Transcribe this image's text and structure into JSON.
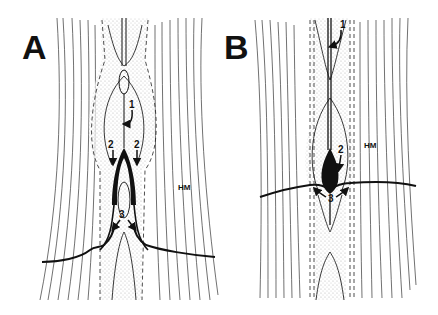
{
  "figure": {
    "panels": [
      {
        "label": "A",
        "tissue_label": "HM",
        "arrows": [
          {
            "number": "1",
            "target": "central-tube-upper"
          },
          {
            "number": "2",
            "target": "left-black-wedge"
          },
          {
            "number": "2",
            "target": "right-black-wedge"
          },
          {
            "number": "3",
            "target": "lower-branch-junction"
          }
        ]
      },
      {
        "label": "B",
        "tissue_label": "HM",
        "arrows": [
          {
            "number": "1",
            "target": "central-tube-upper"
          },
          {
            "number": "2",
            "target": "black-bulb"
          },
          {
            "number": "3",
            "target": "lower-branch-junction"
          }
        ]
      }
    ],
    "colors": {
      "ink": "#111111",
      "stipple": "#bdbdbd",
      "background": "#ffffff"
    }
  }
}
